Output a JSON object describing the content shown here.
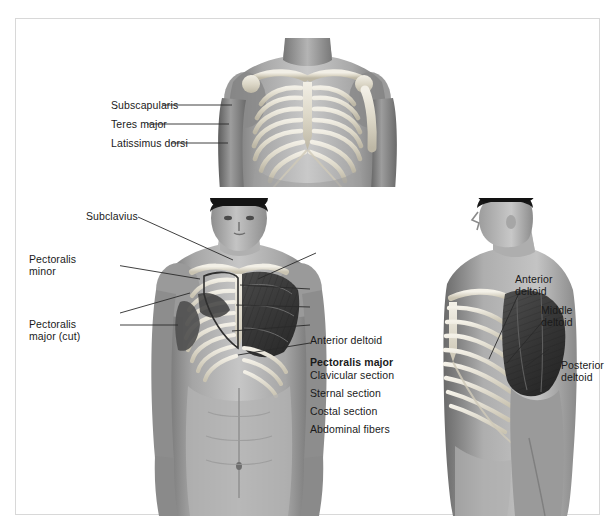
{
  "figure": {
    "background_color": "#ffffff",
    "frame_color": "#d8d8d8",
    "label_color": "#1a1a1a",
    "leader_color": "#2a2a2a",
    "style": "grayscale anatomical photograph overlay illustration"
  },
  "panels": [
    {
      "name": "top-panel",
      "view": "anterior deep view of thorax with rib cage and clavicles",
      "labels": [
        {
          "id": "subscapularis",
          "text": "Subscapularis"
        },
        {
          "id": "teres-major",
          "text": "Teres major"
        },
        {
          "id": "latissimus-dorsi",
          "text": "Latissimus dorsi"
        }
      ]
    },
    {
      "name": "middle-panel",
      "view": "anterior view, pectoralis major cut on subject right, shaded on subject left",
      "labels_left": [
        {
          "id": "subclavius",
          "text": "Subclavius"
        },
        {
          "id": "pectoralis-minor",
          "line1": "Pectoralis",
          "line2": "minor"
        },
        {
          "id": "pectoralis-major-cut",
          "line1": "Pectoralis",
          "line2": "major (cut)"
        }
      ],
      "labels_right": [
        {
          "id": "anterior-deltoid",
          "text": "Anterior deltoid",
          "bold": false
        },
        {
          "id": "pectoralis-major",
          "text": "Pectoralis major",
          "bold": true
        },
        {
          "id": "clavicular-section",
          "text": "Clavicular section",
          "bold": false
        },
        {
          "id": "sternal-section",
          "text": "Sternal section",
          "bold": false
        },
        {
          "id": "costal-section",
          "text": "Costal section",
          "bold": false
        },
        {
          "id": "abdominal-fibers",
          "text": "Abdominal fibers",
          "bold": false
        }
      ]
    },
    {
      "name": "right-panel",
      "view": "three-quarter lateral view showing deltoid and rib cage",
      "labels": [
        {
          "id": "anterior-deltoid",
          "line1": "Anterior",
          "line2": "deltoid"
        },
        {
          "id": "middle-deltoid",
          "line1": "Middle",
          "line2": "deltoid"
        },
        {
          "id": "posterior-deltoid",
          "line1": "Posterior",
          "line2": "deltoid"
        }
      ]
    }
  ]
}
